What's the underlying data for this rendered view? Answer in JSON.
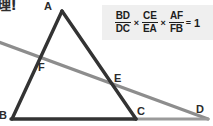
{
  "caption": {
    "text": "理!"
  },
  "formula": {
    "terms": [
      {
        "numerator": "BD",
        "denominator": "DC"
      },
      {
        "numerator": "CE",
        "denominator": "EA"
      },
      {
        "numerator": "AF",
        "denominator": "FB"
      }
    ],
    "multiply_symbol": "×",
    "equals_symbol": "=",
    "result": "1",
    "background_color": "#efefef"
  },
  "figure": {
    "triangle_color": "#333333",
    "transversal_color": "#8a8a8a",
    "vertices": {
      "A": {
        "label": "A",
        "x": 62,
        "y": 11
      },
      "B": {
        "label": "B",
        "x": 12,
        "y": 118
      },
      "C": {
        "label": "C",
        "x": 136,
        "y": 118
      },
      "D": {
        "label": "D",
        "x": 205,
        "y": 118
      },
      "E": {
        "label": "E",
        "x": 110,
        "y": 83
      },
      "F": {
        "label": "F",
        "x": 36,
        "y": 62
      }
    }
  }
}
